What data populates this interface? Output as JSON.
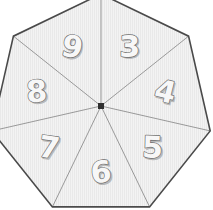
{
  "canvas": {
    "width": 213,
    "height": 210,
    "background_color": "#ffffff"
  },
  "wheel": {
    "name": "heptagon-spinner",
    "shape": "heptagon",
    "sides": 7,
    "center_x": 101,
    "center_y": 106,
    "radius": 112,
    "start_angle_deg": -90,
    "fill_color": "#f2f2f2",
    "hatch_color": "#e2e2e2",
    "border_color": "#4a4a4a",
    "border_width": 1.6,
    "spoke_color": "#8f8f8f",
    "spoke_width": 0.9,
    "hub": {
      "name": "center-hub",
      "color": "#2f2f2f",
      "size": 6
    },
    "sectors": [
      {
        "label": "3",
        "index": 0,
        "mid_angle_deg": -64.3,
        "label_radius": 66,
        "label_rotation_deg": 0
      },
      {
        "label": "4",
        "index": 1,
        "mid_angle_deg": -12.9,
        "label_radius": 66,
        "label_rotation_deg": 14
      },
      {
        "label": "5",
        "index": 2,
        "mid_angle_deg": 38.6,
        "label_radius": 66,
        "label_rotation_deg": 2
      },
      {
        "label": "6",
        "index": 3,
        "mid_angle_deg": 90.0,
        "label_radius": 66,
        "label_rotation_deg": -5
      },
      {
        "label": "7",
        "index": 4,
        "mid_angle_deg": 141.4,
        "label_radius": 66,
        "label_rotation_deg": 8
      },
      {
        "label": "8",
        "index": 5,
        "mid_angle_deg": 192.9,
        "label_radius": 66,
        "label_rotation_deg": -4
      },
      {
        "label": "9",
        "index": 6,
        "mid_angle_deg": 244.3,
        "label_radius": 66,
        "label_rotation_deg": 12
      }
    ]
  }
}
